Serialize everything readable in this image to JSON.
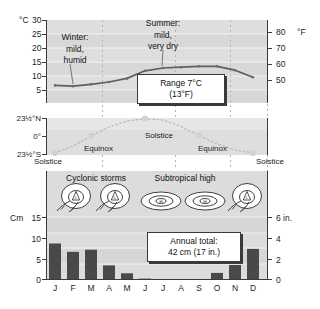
{
  "figure": {
    "panels": [
      "temperature",
      "sun-declination",
      "precipitation"
    ]
  },
  "colors": {
    "plot_background": "#d8d8d8",
    "band_background": "#e2e2e2",
    "temp_line": "#5a5a5a",
    "bar_fill": "#4a4a4a",
    "axis": "#3a3a3a",
    "gridline": "#f2f2f2",
    "dashed_guide": "#b9b9b9",
    "callout_border": "#3a3a3a",
    "callout_fill": "#ffffff"
  },
  "months": [
    "J",
    "F",
    "M",
    "A",
    "M",
    "J",
    "J",
    "A",
    "S",
    "O",
    "N",
    "D"
  ],
  "temperature_panel": {
    "left_unit": "°C",
    "right_unit": "°F",
    "left_ticks": [
      "30",
      "25",
      "20",
      "15",
      "10",
      "5"
    ],
    "right_ticks": [
      "80",
      "70",
      "60",
      "50"
    ],
    "annotations": [
      {
        "name": "winter-note",
        "lines": [
          "Winter:",
          "mild,",
          "humid"
        ]
      },
      {
        "name": "summer-note",
        "lines": [
          "Summer:",
          "mild,",
          "very dry"
        ]
      }
    ],
    "callout": {
      "line1": "Range 7°C",
      "line2": "(13°F)"
    }
  },
  "declination_panel": {
    "ticks": [
      "23¹1/2°N",
      "0°",
      "23¹1/2°S"
    ],
    "tick_north": "23½°N",
    "tick_zero": "0°",
    "tick_south": "23½°S",
    "labels": [
      {
        "name": "solstice-left",
        "text": "Solstice"
      },
      {
        "name": "equinox-spring",
        "text": "Equinox"
      },
      {
        "name": "solstice-mid",
        "text": "Solstice"
      },
      {
        "name": "equinox-fall",
        "text": "Equinox"
      },
      {
        "name": "solstice-right",
        "text": "Solstice"
      }
    ]
  },
  "precipitation_panel": {
    "left_unit": "Cm",
    "right_unit": "6 in.",
    "left_ticks": [
      "15",
      "10",
      "5",
      "0"
    ],
    "right_ticks": [
      "6 in.",
      "4",
      "2",
      "0"
    ],
    "headers": [
      {
        "name": "cyclonic-storms-header",
        "text": "Cyclonic storms"
      },
      {
        "name": "subtropical-high-header",
        "text": "Subtropical high"
      }
    ],
    "callout": {
      "line1": "Annual total:",
      "line2": "42 cm (17 in.)"
    },
    "pressure_symbols": [
      {
        "name": "cyclone-symbol-jan",
        "type": "low",
        "letter": "L"
      },
      {
        "name": "cyclone-symbol-mar",
        "type": "low",
        "letter": "L"
      },
      {
        "name": "high-symbol-jun",
        "type": "high",
        "letter": "H"
      },
      {
        "name": "high-symbol-aug",
        "type": "high",
        "letter": "H"
      },
      {
        "name": "cyclone-symbol-nov",
        "type": "low",
        "letter": "L"
      }
    ]
  },
  "chart_data": [
    {
      "type": "line",
      "name": "temperature",
      "title": "Monthly mean temperature",
      "categories": [
        "J",
        "F",
        "M",
        "A",
        "M",
        "J",
        "J",
        "A",
        "S",
        "O",
        "N",
        "D"
      ],
      "values": [
        9.5,
        9.2,
        9.9,
        10.7,
        12.0,
        14.7,
        15.7,
        16.0,
        16.3,
        16.3,
        14.9,
        12.4
      ],
      "values_dec": 10.3,
      "xlabel": "",
      "ylabel": "°C",
      "ylim": [
        5,
        30
      ],
      "yticks": [
        5,
        10,
        15,
        20,
        25,
        30
      ],
      "y2label": "°F",
      "y2lim": [
        41,
        86
      ],
      "y2ticks": [
        50,
        60,
        70,
        80
      ],
      "grid": true,
      "annotation": "Range 7°C (13°F)"
    },
    {
      "type": "line",
      "name": "sun-declination",
      "title": "Declination of the sun",
      "categories": [
        "J",
        "F",
        "M",
        "A",
        "M",
        "J",
        "J",
        "A",
        "S",
        "O",
        "N",
        "D"
      ],
      "values": [
        -23.5,
        -14.0,
        -2.0,
        10.0,
        19.0,
        23.5,
        21.0,
        13.0,
        1.0,
        -11.0,
        -20.0,
        -23.5
      ],
      "ylabel": "",
      "ylim": [
        -23.5,
        23.5
      ],
      "yticks": [
        -23.5,
        0,
        23.5
      ],
      "ytick_labels": [
        "23½°S",
        "0°",
        "23½°N"
      ],
      "grid": false,
      "annotations": [
        "Solstice",
        "Equinox",
        "Solstice",
        "Equinox",
        "Solstice"
      ]
    },
    {
      "type": "bar",
      "name": "precipitation",
      "title": "Monthly precipitation",
      "categories": [
        "J",
        "F",
        "M",
        "A",
        "M",
        "J",
        "J",
        "A",
        "S",
        "O",
        "N",
        "D"
      ],
      "values": [
        8.7,
        6.7,
        7.2,
        3.4,
        1.5,
        0.2,
        0.0,
        0.0,
        0.0,
        1.6,
        3.5,
        7.4
      ],
      "xlabel": "",
      "ylabel": "Cm",
      "ylim": [
        0,
        15
      ],
      "yticks": [
        0,
        5,
        10,
        15
      ],
      "y2label": "in.",
      "y2lim": [
        0,
        6
      ],
      "y2ticks": [
        0,
        2,
        4,
        6
      ],
      "grid": true,
      "annotation": "Annual total: 42 cm (17 in.)"
    }
  ]
}
